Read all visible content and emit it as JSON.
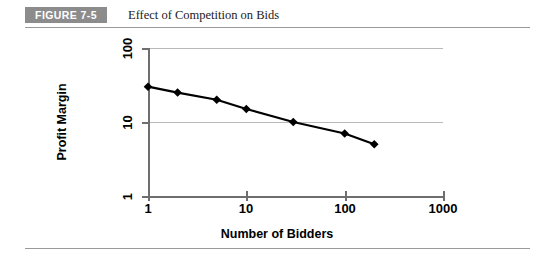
{
  "figure": {
    "tag": "FIGURE 7-5",
    "caption": "Effect of Competition on Bids"
  },
  "colors": {
    "tag_background": "#8c8c8c",
    "tag_text": "#ffffff",
    "rule": "#9a9a9a",
    "gridline": "#b9b9b9",
    "axis": "#6e6e6e",
    "series": "#000000"
  },
  "chart_data": {
    "type": "line",
    "title": "Effect of Competition on Bids",
    "xlabel": "Number of Bidders",
    "ylabel": "Profit Margin",
    "xscale": "log",
    "yscale": "log",
    "xlim": [
      1,
      1000
    ],
    "ylim": [
      1,
      100
    ],
    "xticks": [
      1,
      10,
      100,
      1000
    ],
    "xtick_labels": [
      "1",
      "10",
      "100",
      "1000"
    ],
    "yticks": [
      1,
      10,
      100
    ],
    "ytick_labels": [
      "1",
      "10",
      "100"
    ],
    "grid": "horizontal",
    "legend": "none",
    "marker": "diamond",
    "series": [
      {
        "name": "Profit Margin",
        "x": [
          1,
          2,
          5,
          10,
          30,
          100,
          200
        ],
        "values": [
          30,
          25,
          20,
          15,
          10,
          7,
          5
        ]
      }
    ]
  }
}
